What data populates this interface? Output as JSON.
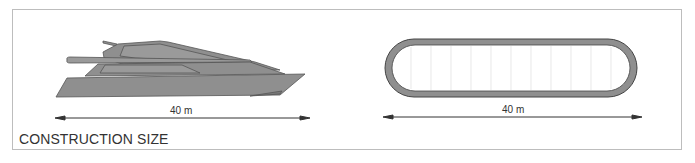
{
  "caption": "CONSTRUCTION SIZE",
  "figures": [
    {
      "name": "yacht-side-view",
      "dimension_label": "40 m"
    },
    {
      "name": "hull-plan-view",
      "dimension_label": "40 m"
    }
  ],
  "colors": {
    "hull_fill": "#8f8f8f",
    "outline": "#444444",
    "frame_border": "#bdbdbd",
    "text": "#333333"
  }
}
